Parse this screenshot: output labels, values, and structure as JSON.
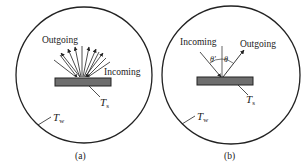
{
  "panels": [
    {
      "id": "a",
      "caption": "(a)",
      "outgoing_label": "Outgoing",
      "incoming_label": "Incoming",
      "surface_temp": "T",
      "surface_sub": "s",
      "wall_temp": "T",
      "wall_sub": "w",
      "description": "Diffuse reflection"
    },
    {
      "id": "b",
      "caption": "(b)",
      "outgoing_label": "Outgoing",
      "incoming_label": "Incoming",
      "angle_in": "θ'",
      "angle_out": "θ",
      "surface_temp": "T",
      "surface_sub": "s",
      "wall_temp": "T",
      "wall_sub": "w",
      "description": "Specular reflection"
    }
  ],
  "colors": {
    "line": "#222222",
    "surface_fill": "#6e6e6e"
  }
}
